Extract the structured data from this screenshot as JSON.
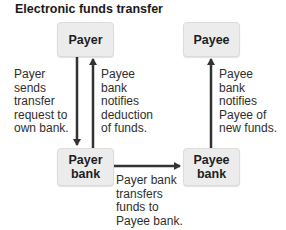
{
  "title": "Electronic funds transfer",
  "nodes": {
    "payer": "Payer",
    "payee": "Payee",
    "payer_bank": "Payer\nbank",
    "payee_bank": "Payee\nbank"
  },
  "edges": {
    "payer_to_payer_bank": "Payer\nsends\ntransfer\nrequest to\nown bank.",
    "payer_bank_to_payer": "Payee\nbank\nnotifies\ndeduction\nof funds.",
    "payer_bank_to_payee_bank": "Payer bank\ntransfers\nfunds to\nPayee bank.",
    "payee_bank_to_payee": "Payee\nbank\nnotifies\nPayee of\nnew funds."
  },
  "colors": {
    "box_fill": "#ececec",
    "arrow": "#333333",
    "text": "#2e2e2e"
  }
}
